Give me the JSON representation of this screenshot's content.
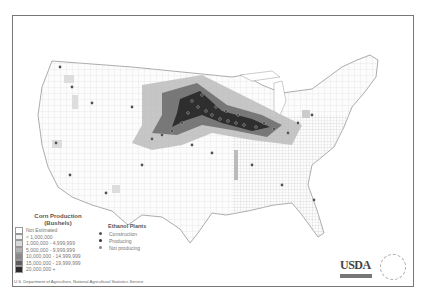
{
  "map": {
    "title": "Corn Production and Ethanol Plants",
    "background": "#ffffff",
    "border_color": "#777777"
  },
  "legend": {
    "title_line1": "Corn Production",
    "title_line2": "(Bushels)",
    "classes": [
      {
        "label": "Not Estimated",
        "color": "#ffffff"
      },
      {
        "label": "< 1,000,000",
        "color": "#f2f2f2"
      },
      {
        "label": "1,000,000 - 4,999,999",
        "color": "#d9d9d9"
      },
      {
        "label": "5,000,000 - 9,999,999",
        "color": "#b3b3b3"
      },
      {
        "label": "10,000,000 - 14,999,999",
        "color": "#8a8a8a"
      },
      {
        "label": "15,000,000 - 19,999,999",
        "color": "#5e5e5e"
      },
      {
        "label": "20,000,000 +",
        "color": "#2b2b2b"
      }
    ]
  },
  "plants_legend": {
    "title": "Ethanol Plants",
    "items": [
      {
        "label": "Construction",
        "color": "#555555"
      },
      {
        "label": "Producing",
        "color": "#333333"
      },
      {
        "label": "Not producing",
        "color": "#888888"
      }
    ]
  },
  "footer": {
    "source": "U.S. Department of Agriculture, National Agricultural Statistics Service"
  },
  "logos": {
    "usda": "USDA",
    "seal": "Agricultural Statistics Service seal"
  }
}
